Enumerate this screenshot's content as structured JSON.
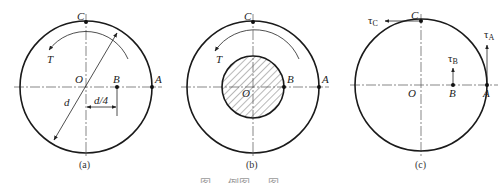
{
  "figure": {
    "caption_bottom": "图 ··· 例图 ··· 图",
    "caption_bottom_note": "clipped at bottom edge",
    "colors": {
      "stroke": "#1a1a1a",
      "axis": "#555555",
      "background": "#ffffff"
    }
  },
  "panels": [
    {
      "id": "a",
      "caption": "(a)",
      "center_label": "O",
      "points": {
        "C": "C",
        "A": "A",
        "B": "B"
      },
      "torque_label": "T",
      "diameter_label": "d",
      "dimension_label": "d/4",
      "description": "Solid circular section, torque T, point B at d/4 from center"
    },
    {
      "id": "b",
      "caption": "(b)",
      "center_label": "O",
      "points": {
        "C": "C",
        "A": "A",
        "B": "B"
      },
      "torque_label": "T",
      "description": "Hollow/annular view with hatched inner core, B on inner boundary"
    },
    {
      "id": "c",
      "caption": "(c)",
      "center_label": "O",
      "points": {
        "C": "C",
        "A": "A",
        "B": "B"
      },
      "stress_labels": {
        "C": "τ",
        "C_sub": "C",
        "A": "τ",
        "A_sub": "A",
        "B": "τ",
        "B_sub": "B"
      },
      "description": "Shear stress vectors τA, τB, τC at points A, B, C"
    }
  ]
}
